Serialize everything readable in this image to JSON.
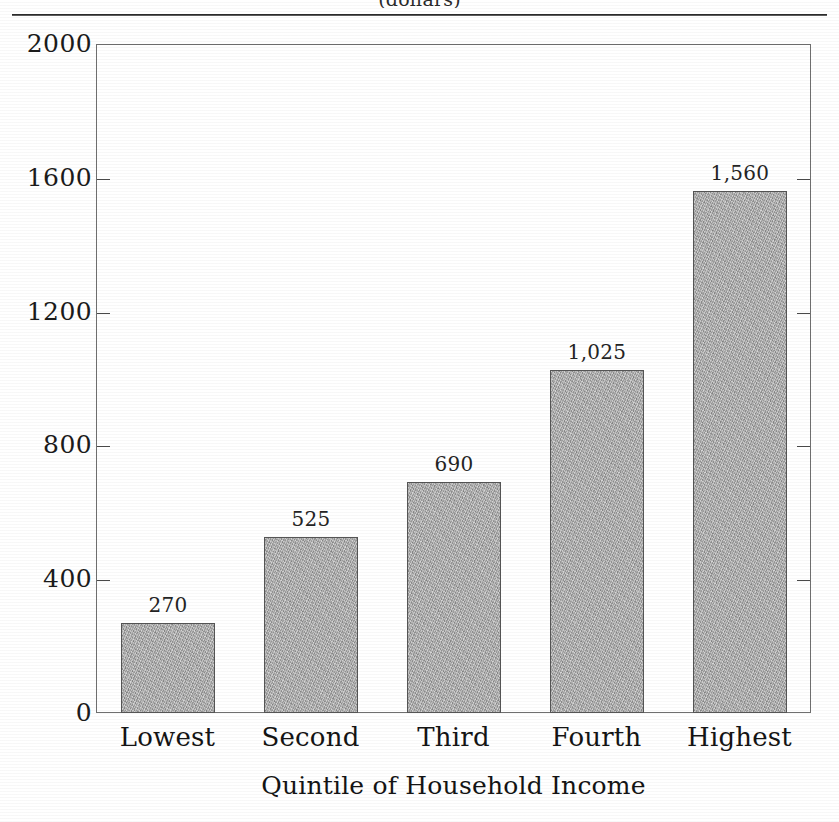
{
  "figure": {
    "caption_fragment": "(dollars)",
    "x_axis_title": "Quintile of Household Income"
  },
  "chart_data": {
    "type": "bar",
    "title": "(dollars)",
    "xlabel": "Quintile of Household Income",
    "ylabel": "",
    "categories": [
      "Lowest",
      "Second",
      "Third",
      "Fourth",
      "Highest"
    ],
    "values": [
      270,
      525,
      690,
      1025,
      1560
    ],
    "value_labels": [
      "270",
      "525",
      "690",
      "1,025",
      "1,560"
    ],
    "ylim": [
      0,
      2000
    ],
    "ytick_values": [
      0,
      400,
      800,
      1200,
      1600,
      2000
    ],
    "ytick_labels": [
      "0",
      "400",
      "800",
      "1200",
      "1600",
      "2000"
    ],
    "grid": false,
    "legend": null,
    "bar_color": "#aaaaaa",
    "bar_edge_color": "#555555",
    "frame_color": "#6f6f6f"
  }
}
